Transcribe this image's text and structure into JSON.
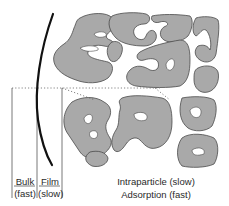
{
  "diagram": {
    "type": "adsorption-mass-transfer-schematic",
    "colors": {
      "particle_fill": "#a9a9a9",
      "particle_stroke": "#4a4a4a",
      "film_boundary": "#111111",
      "divider": "#555555",
      "dotted": "#666666"
    },
    "regions": {
      "bulk": {
        "label": "Bulk",
        "rate": "(fast)"
      },
      "film": {
        "label": "Film",
        "rate": "(slow)"
      },
      "intraparticle": {
        "label": "Intraparticle (slow)"
      },
      "adsorption": {
        "label": "Adsorption (fast)"
      }
    }
  }
}
